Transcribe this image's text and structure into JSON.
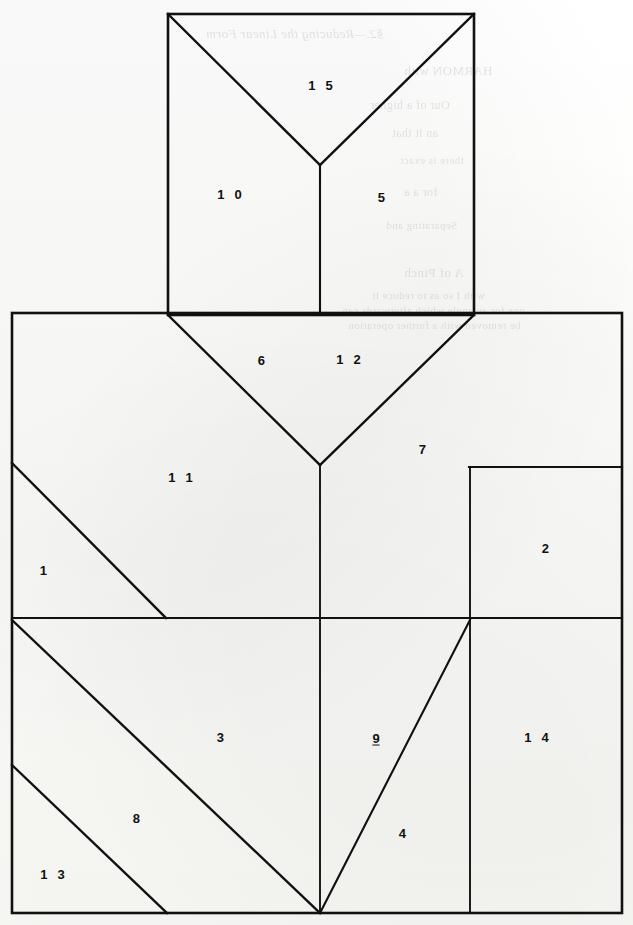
{
  "figure": {
    "canvas": {
      "width": 633,
      "height": 925
    },
    "ink_color": "#111111",
    "paper_color": "#fbfbf9",
    "stroke_width": 2.4,
    "regions": [
      {
        "id": "1",
        "label": "1",
        "x": 45,
        "y": 570,
        "underlined": false
      },
      {
        "id": "2",
        "label": "2",
        "x": 547,
        "y": 548,
        "underlined": false
      },
      {
        "id": "3",
        "label": "3",
        "x": 222,
        "y": 737,
        "underlined": false
      },
      {
        "id": "4",
        "label": "4",
        "x": 404,
        "y": 833,
        "underlined": false
      },
      {
        "id": "5",
        "label": "5",
        "x": 383,
        "y": 197,
        "underlined": false
      },
      {
        "id": "6",
        "label": "6",
        "x": 263,
        "y": 360,
        "underlined": false
      },
      {
        "id": "7",
        "label": "7",
        "x": 424,
        "y": 449,
        "underlined": false
      },
      {
        "id": "8",
        "label": "8",
        "x": 138,
        "y": 818,
        "underlined": false
      },
      {
        "id": "9",
        "label": "9",
        "x": 376,
        "y": 738,
        "underlined": true
      },
      {
        "id": "10",
        "label": "1 0",
        "x": 231,
        "y": 194,
        "underlined": false
      },
      {
        "id": "11",
        "label": "1 1",
        "x": 182,
        "y": 477,
        "underlined": false
      },
      {
        "id": "12",
        "label": "1 2",
        "x": 350,
        "y": 359,
        "underlined": false
      },
      {
        "id": "13",
        "label": "1 3",
        "x": 54,
        "y": 874,
        "underlined": false
      },
      {
        "id": "14",
        "label": "1 4",
        "x": 538,
        "y": 737,
        "underlined": false
      },
      {
        "id": "15",
        "label": "1 5",
        "x": 322,
        "y": 85,
        "underlined": false
      }
    ],
    "outline_top_box": {
      "left": 168,
      "right": 474,
      "top": 14,
      "bottom": 315
    },
    "outline_main_rect": {
      "left": 12,
      "right": 622,
      "top": 313,
      "bottom": 913
    },
    "cut_lines": [
      {
        "name": "top-box-v-left",
        "x1": 168,
        "y1": 14,
        "x2": 320,
        "y2": 165
      },
      {
        "name": "top-box-v-right",
        "x1": 474,
        "y1": 14,
        "x2": 320,
        "y2": 165
      },
      {
        "name": "top-box-stem",
        "x1": 320,
        "y1": 165,
        "x2": 320,
        "y2": 315
      },
      {
        "name": "main-v-left",
        "x1": 168,
        "y1": 315,
        "x2": 320,
        "y2": 465
      },
      {
        "name": "main-v-right",
        "x1": 474,
        "y1": 315,
        "x2": 320,
        "y2": 465
      },
      {
        "name": "main-center-stem",
        "x1": 320,
        "y1": 465,
        "x2": 320,
        "y2": 913
      },
      {
        "name": "mid-horizontal",
        "x1": 12,
        "y1": 618,
        "x2": 622,
        "y2": 618
      },
      {
        "name": "right-vertical",
        "x1": 470,
        "y1": 467,
        "x2": 470,
        "y2": 913
      },
      {
        "name": "notch-horizontal",
        "x1": 470,
        "y1": 467,
        "x2": 622,
        "y2": 467
      },
      {
        "name": "diag-region-1",
        "x1": 12,
        "y1": 463,
        "x2": 166,
        "y2": 618
      },
      {
        "name": "diag-region-3",
        "x1": 12,
        "y1": 620,
        "x2": 320,
        "y2": 913
      },
      {
        "name": "diag-region-13",
        "x1": 12,
        "y1": 765,
        "x2": 167,
        "y2": 913
      },
      {
        "name": "diag-region-9-4",
        "x1": 320,
        "y1": 913,
        "x2": 470,
        "y2": 620
      }
    ]
  },
  "bleed_through": [
    {
      "text": "§2.—Reducing the Linear Form",
      "x": 206,
      "y": 26,
      "size": 13,
      "style": "italic"
    },
    {
      "text": "HARMON  with",
      "x": 404,
      "y": 63,
      "size": 13,
      "style": "normal"
    },
    {
      "text": "Our of a  higher",
      "x": 370,
      "y": 98,
      "size": 12,
      "style": "normal"
    },
    {
      "text": "an it that",
      "x": 392,
      "y": 126,
      "size": 12,
      "style": "normal"
    },
    {
      "text": "there is exact",
      "x": 400,
      "y": 154,
      "size": 11,
      "style": "normal"
    },
    {
      "text": "for  a  a",
      "x": 404,
      "y": 185,
      "size": 12,
      "style": "normal"
    },
    {
      "text": "Separating and",
      "x": 386,
      "y": 219,
      "size": 11,
      "style": "normal"
    },
    {
      "text": "A of Pinch",
      "x": 404,
      "y": 265,
      "size": 13,
      "style": "normal"
    },
    {
      "text": "with  I so as to reduce  it",
      "x": 372,
      "y": 289,
      "size": 11,
      "style": "normal"
    },
    {
      "text": "one for an angle which afterwards can",
      "x": 342,
      "y": 304,
      "size": 11,
      "style": "normal"
    },
    {
      "text": "be removed with a further operation",
      "x": 348,
      "y": 319,
      "size": 11,
      "style": "normal"
    }
  ]
}
